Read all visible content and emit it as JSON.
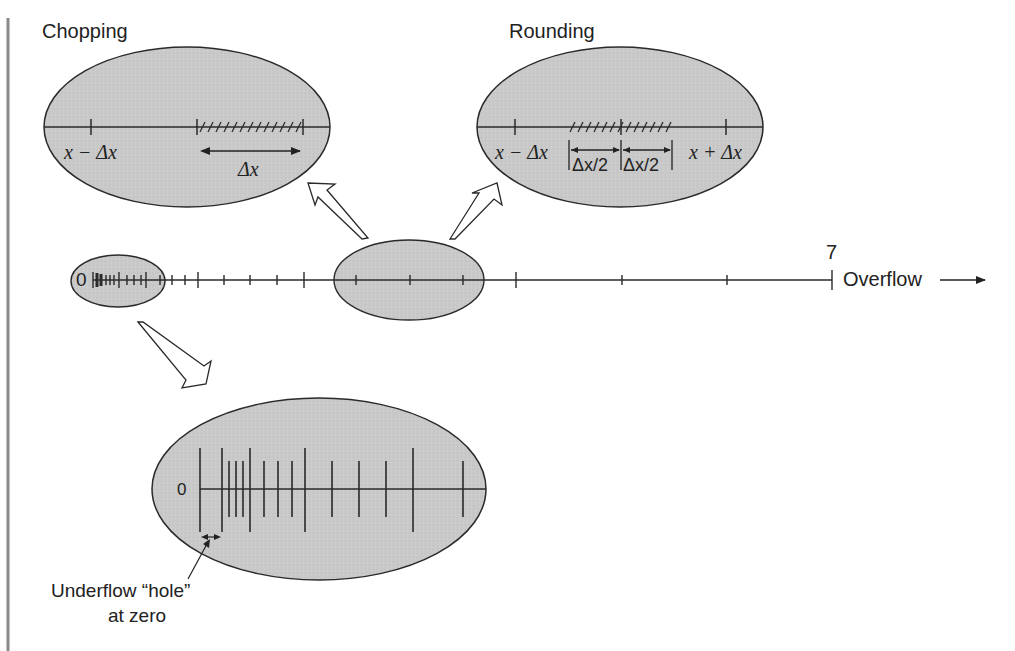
{
  "figure": {
    "titles": {
      "chopping": "Chopping",
      "rounding": "Rounding"
    },
    "chopping_bubble": {
      "left_label": "x − Δx",
      "interval_label": "Δx"
    },
    "rounding_bubble": {
      "left_label": "x − Δx",
      "right_label": "x + Δx",
      "half_left_label": "Δx/2",
      "half_right_label": "Δx/2"
    },
    "number_line": {
      "zero_label": "0",
      "max_label": "7",
      "overflow_label": "Overflow"
    },
    "underflow_bubble": {
      "zero_label": "0",
      "caption_line1": "Underflow “hole”",
      "caption_line2": "at zero"
    },
    "colors": {
      "bubble_fill": "#c8c8c8",
      "line": "#2a2a2a",
      "margin_bar": "#8a8a8a"
    }
  }
}
